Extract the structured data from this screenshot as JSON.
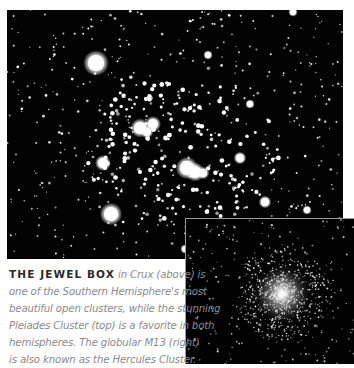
{
  "main_photo": {
    "subject": "Jewel Box open cluster in Crux",
    "bright_stars": [
      {
        "x": 89,
        "y": 53,
        "r": 8
      },
      {
        "x": 104,
        "y": 204,
        "r": 7
      },
      {
        "x": 96,
        "y": 153,
        "r": 5
      },
      {
        "x": 133,
        "y": 118,
        "r": 6
      },
      {
        "x": 146,
        "y": 114,
        "r": 5
      },
      {
        "x": 140,
        "y": 122,
        "r": 4
      },
      {
        "x": 180,
        "y": 158,
        "r": 7
      },
      {
        "x": 188,
        "y": 162,
        "r": 6
      },
      {
        "x": 196,
        "y": 163,
        "r": 4
      },
      {
        "x": 233,
        "y": 148,
        "r": 4
      },
      {
        "x": 258,
        "y": 192,
        "r": 4
      },
      {
        "x": 178,
        "y": 239,
        "r": 3
      },
      {
        "x": 300,
        "y": 200,
        "r": 3
      },
      {
        "x": 201,
        "y": 45,
        "r": 3
      },
      {
        "x": 243,
        "y": 94,
        "r": 3
      },
      {
        "x": 286,
        "y": 2,
        "r": 3
      }
    ]
  },
  "inset_photo": {
    "subject": "Globular cluster M13",
    "core": {
      "x": 96,
      "y": 75,
      "r": 32
    }
  },
  "caption": {
    "lead": "THE JEWEL BOX",
    "lines": [
      " in Crux (above) is",
      "one of the Southern Hemisphere's most",
      "beautiful open clusters, while the stunning",
      "Pleiades Cluster (top) is a favorite in both",
      "hemispheres. The globular M13 (right)",
      "is also known as the Hercules Cluster."
    ]
  }
}
